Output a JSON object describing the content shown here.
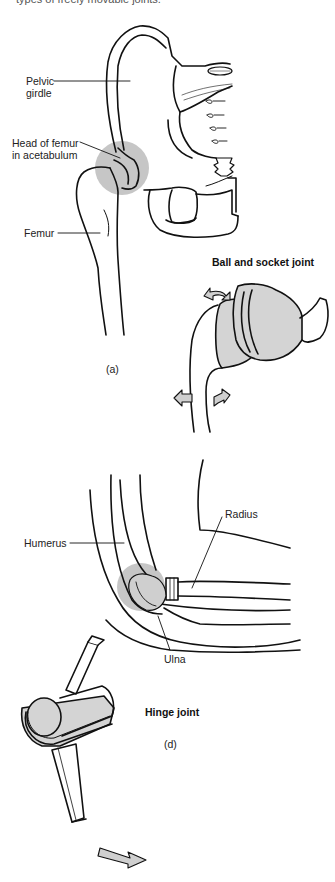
{
  "header": {
    "text": "types of freely movable joints."
  },
  "colors": {
    "line": "#111111",
    "highlight": "#c6c6c6",
    "fill": "#d4d4d4",
    "background": "#ffffff"
  },
  "figure_a": {
    "id_label": "(a)",
    "title": "Ball and socket joint",
    "labels": {
      "pelvic_girdle_line1": "Pelvic",
      "pelvic_girdle_line2": "girdle",
      "head_of_femur_line1": "Head of femur",
      "head_of_femur_line2": "in acetabulum",
      "femur": "Femur"
    }
  },
  "figure_d": {
    "id_label": "(d)",
    "title": "Hinge joint",
    "labels": {
      "humerus": "Humerus",
      "radius": "Radius",
      "ulna": "Ulna"
    }
  }
}
